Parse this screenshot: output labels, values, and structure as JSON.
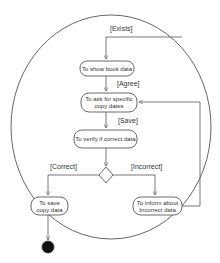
{
  "diagram": {
    "type": "uml-activity",
    "boundary": {
      "shape": "ellipse",
      "cx": 111,
      "cy": 127,
      "rx": 100,
      "ry": 112
    },
    "nodes": [
      {
        "id": "show-book-data",
        "label_lines": [
          "To show book data"
        ],
        "x": 80,
        "y": 61,
        "w": 54,
        "h": 15
      },
      {
        "id": "ask-copy-dates",
        "label_lines": [
          "To ask for specific",
          "copy dates"
        ],
        "x": 81,
        "y": 93,
        "w": 56,
        "h": 19
      },
      {
        "id": "verify-data",
        "label_lines": [
          "To verify if correct data"
        ],
        "x": 74,
        "y": 130,
        "w": 63,
        "h": 18
      },
      {
        "id": "save-copy-data",
        "label_lines": [
          "To save",
          "copy data"
        ],
        "x": 31,
        "y": 197,
        "w": 37,
        "h": 18
      },
      {
        "id": "inform-incorrect",
        "label_lines": [
          "To inform about",
          "Incorrect data"
        ],
        "x": 133,
        "y": 197,
        "w": 49,
        "h": 18
      }
    ],
    "decision": {
      "cx": 106,
      "cy": 175,
      "w": 14,
      "h": 16
    },
    "final_node": {
      "cx": 48,
      "cy": 247,
      "r": 6
    },
    "guards": {
      "exists": "[Exists]",
      "agree": "[Agree]",
      "save": "[Save]",
      "correct": "[Correct]",
      "incorrect": "[Incorrect]"
    }
  },
  "text": {
    "node_show_book_data": "To show book data",
    "node_ask_line1": "To ask for specific",
    "node_ask_line2": "copy dates",
    "node_verify": "To verify if correct data",
    "node_save_line1": "To save",
    "node_save_line2": "copy data",
    "node_inform_line1": "To inform about",
    "node_inform_line2": "Incorrect data",
    "guard_exists": "[Exists]",
    "guard_agree": "[Agree]",
    "guard_save": "[Save]",
    "guard_correct": "[Correct]",
    "guard_incorrect": "[Incorrect]"
  },
  "colors": {
    "background": "#ffffff",
    "line": "#555555",
    "text": "#333333",
    "final_node_fill": "#111111"
  }
}
